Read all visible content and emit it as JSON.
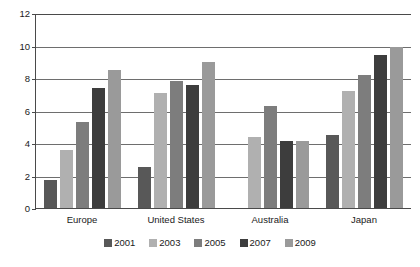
{
  "chart_data": {
    "type": "bar",
    "title": "",
    "subtitle": "",
    "xlabel": "",
    "ylabel": "",
    "categories": [
      "Europe",
      "United States",
      "Australia",
      "Japan"
    ],
    "series": [
      {
        "name": "2001",
        "color": "#585858",
        "values": [
          1.7,
          2.5,
          null,
          4.5
        ]
      },
      {
        "name": "2003",
        "color": "#b0b0b0",
        "values": [
          3.6,
          7.1,
          4.4,
          7.2
        ]
      },
      {
        "name": "2005",
        "color": "#7d7d7d",
        "values": [
          5.3,
          7.8,
          6.3,
          8.2
        ]
      },
      {
        "name": "2007",
        "color": "#3d3d3d",
        "values": [
          7.4,
          7.6,
          4.1,
          9.4
        ]
      },
      {
        "name": "2009",
        "color": "#9a9a9a",
        "values": [
          8.5,
          9.0,
          4.1,
          9.9
        ]
      }
    ],
    "ylim": [
      0,
      12
    ],
    "yticks": [
      0,
      2,
      4,
      6,
      8,
      10,
      12
    ],
    "ytick_labels": [
      "0",
      "2",
      "4",
      "6",
      "8",
      "10",
      "12"
    ],
    "grid": true,
    "grid_axis": "y",
    "legend_position": "bottom",
    "axis_color": "#4a4a4a",
    "grid_color": "#6e6e6e",
    "background": "#ffffff"
  }
}
